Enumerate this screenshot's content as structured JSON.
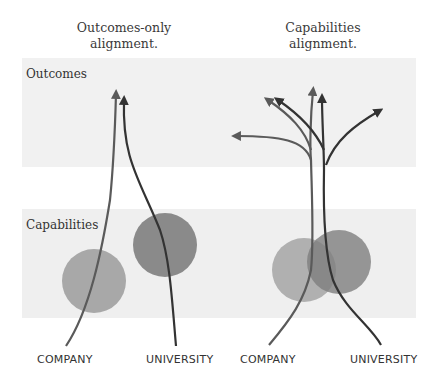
{
  "panels": [
    {
      "title_line1": "Outcomes-only",
      "title_line2": "alignment.",
      "company_label": "COMPANY",
      "university_label": "UNIVERSITY"
    },
    {
      "title_line1": "Capabilities",
      "title_line2": "alignment.",
      "company_label": "COMPANY",
      "university_label": "UNIVERSITY"
    }
  ],
  "bands": {
    "outcomes": {
      "label": "Outcomes",
      "color": "#f1f1f1"
    },
    "capabilities": {
      "label": "Capabilities",
      "color": "#efefef"
    }
  },
  "colors": {
    "company_circle": "#a8a8a8",
    "university_circle": "#8a8a8a",
    "company_arrow": "#5a5a5a",
    "university_arrow": "#333333"
  }
}
